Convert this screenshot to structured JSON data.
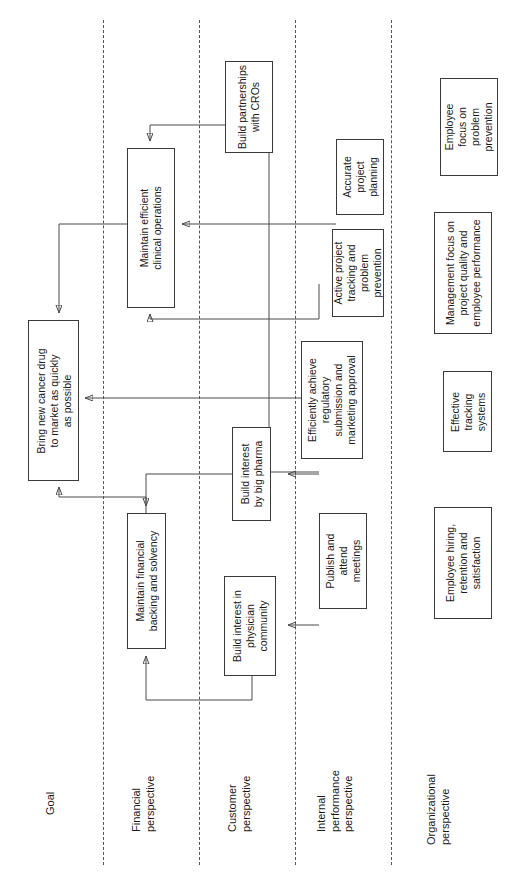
{
  "diagram": {
    "orientation": "rotated-90-ccw",
    "lanes": [
      {
        "id": "goal",
        "label": "Goal"
      },
      {
        "id": "financial",
        "label": "Financial\nperspective"
      },
      {
        "id": "customer",
        "label": "Customer\nperspective"
      },
      {
        "id": "internal",
        "label": "Internal\nperformance\nperspective"
      },
      {
        "id": "organizational",
        "label": "Organizational\nperspective"
      }
    ],
    "nodes": [
      {
        "id": "goal-drug",
        "lane": "goal",
        "label": "Bring new cancer drug\nto market as quickly\nas possible"
      },
      {
        "id": "fin-backing",
        "lane": "financial",
        "label": "Maintain financial\nbacking and solvency"
      },
      {
        "id": "ops-clinical",
        "lane": "financial",
        "label": "Maintain efficient\nclinical operations"
      },
      {
        "id": "cust-bigpharma",
        "lane": "customer",
        "label": "Build interest\nby big pharma"
      },
      {
        "id": "cust-physician",
        "lane": "customer",
        "label": "Build interest in\nphysician\ncommunity"
      },
      {
        "id": "int-cro",
        "lane": "customer",
        "label": "Build partnerships\nwith CROs"
      },
      {
        "id": "int-regulatory",
        "lane": "internal",
        "label": "Efficiently achieve\nregulatory\nsubmission and\nmarketing approval"
      },
      {
        "id": "int-publish",
        "lane": "internal",
        "label": "Publish and\nattend\nmeetings"
      },
      {
        "id": "int-planning",
        "lane": "internal",
        "label": "Accurate\nproject\nplanning"
      },
      {
        "id": "int-tracking",
        "lane": "internal",
        "label": "Active project\ntracking and\nproblem\nprevention"
      },
      {
        "id": "org-employee-focus",
        "lane": "organizational",
        "label": "Employee\nfocus on\nproblem\nprevention"
      },
      {
        "id": "org-mgmt-focus",
        "lane": "organizational",
        "label": "Management focus on\nproject quality and\nemployee performance"
      },
      {
        "id": "org-tracking-sys",
        "lane": "organizational",
        "label": "Effective\ntracking\nsystems"
      },
      {
        "id": "org-hiring",
        "lane": "organizational",
        "label": "Employee hiring,\nretention and\nsatisfaction"
      }
    ],
    "links": [
      {
        "from": "ops-clinical",
        "to": "goal-drug"
      },
      {
        "from": "int-regulatory",
        "to": "goal-drug"
      },
      {
        "from": "fin-backing",
        "to": "goal-drug"
      },
      {
        "from": "int-cro",
        "to": "ops-clinical"
      },
      {
        "from": "int-planning",
        "to": "ops-clinical"
      },
      {
        "from": "int-tracking",
        "to": "ops-clinical"
      },
      {
        "from": "int-publish",
        "to": "int-cro"
      },
      {
        "from": "cust-bigpharma",
        "to": "fin-backing"
      },
      {
        "from": "cust-physician",
        "to": "fin-backing"
      },
      {
        "from": "int-publish",
        "to": "cust-bigpharma"
      },
      {
        "from": "int-publish",
        "to": "cust-physician"
      }
    ],
    "colors": {
      "node_border": "#3a3a3a",
      "lane_divider": "#555555",
      "wire": "#4a4a4a",
      "text": "#1a1a1a",
      "background": "#ffffff"
    }
  }
}
